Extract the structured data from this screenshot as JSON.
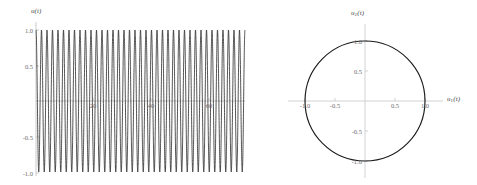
{
  "figure": {
    "title": "",
    "panels": [
      "time-series",
      "phase-portrait"
    ]
  },
  "left_panel": {
    "ylabel": "u(t)",
    "xlabel": "",
    "y_ticks": [
      "1.0",
      "0.5",
      "-0.5",
      "-1.0"
    ],
    "x_ticks": [
      "20",
      "40",
      "60"
    ]
  },
  "right_panel": {
    "xlabel_main": "u",
    "xlabel_sub": "1",
    "xlabel_tail": "(t)",
    "ylabel_main": "u",
    "ylabel_sub": "2",
    "ylabel_tail": "(t)",
    "x_ticks": [
      "-1.0",
      "-0.5",
      "0.5",
      "1.0"
    ],
    "y_ticks": [
      "1.0",
      "0.5",
      "-0.5",
      "-1.0"
    ]
  },
  "colors": {
    "curve": "#1a1a1a",
    "axis": "#b9b9b9",
    "text": "#5a5a5a",
    "background": "#ffffff"
  },
  "chart_data": [
    {
      "type": "line",
      "name": "time-series",
      "title": "",
      "xlabel": "t",
      "ylabel": "u(t)",
      "xlim": [
        0,
        72
      ],
      "ylim": [
        -1.12,
        1.12
      ],
      "x_ticks": [
        20,
        40,
        60
      ],
      "y_ticks": [
        -1.0,
        -0.5,
        0.5,
        1.0
      ],
      "grid": false,
      "legend": "none",
      "description": "Rapid sinusoidal oscillation of constant unit amplitude, about 38 full cycles over the plotted interval; envelope flat at +/-1.0",
      "series": [
        {
          "name": "u(t)",
          "form": "cos(omega*t)",
          "amplitude": 1.0,
          "cycles_shown": 38,
          "period": 1.9,
          "color": "#1a1a1a"
        }
      ]
    },
    {
      "type": "line",
      "name": "phase-portrait",
      "title": "",
      "xlabel": "u_1(t)",
      "ylabel": "u_2(t)",
      "xlim": [
        -1.22,
        1.22
      ],
      "ylim": [
        -1.18,
        1.18
      ],
      "x_ticks": [
        -1.0,
        -0.5,
        0.5,
        1.0
      ],
      "y_ticks": [
        -1.0,
        -0.5,
        0.5,
        1.0
      ],
      "grid": false,
      "legend": "none",
      "description": "Closed circular orbit of radius 1.0 centered at the origin (conserved energy limit cycle)",
      "series": [
        {
          "name": "orbit",
          "shape": "circle",
          "center": [
            0,
            0
          ],
          "radius": 1.0,
          "color": "#1a1a1a"
        }
      ]
    }
  ]
}
